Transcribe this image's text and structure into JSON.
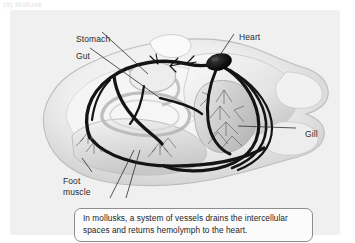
{
  "figure": {
    "header": "(b) Mollusk"
  },
  "panel": {
    "background_color": "#f0f0f0",
    "illustration_name": "mollusk-circulatory-system-illustration"
  },
  "labels": [
    {
      "id": "stomach",
      "text": "Stomach"
    },
    {
      "id": "gut",
      "text": "Gut"
    },
    {
      "id": "heart",
      "text": "Heart"
    },
    {
      "id": "gill",
      "text": "Gill"
    },
    {
      "id": "foot-muscle",
      "text": "Foot\nmuscle"
    }
  ],
  "caption": {
    "text": "In mollusks, a system of vessels drains the intercellular spaces and returns hemolymph to the heart.",
    "border_color": "#8d8d8d",
    "background_color": "#fbfbfb"
  },
  "colors": {
    "vessel": "#141414",
    "leader_line": "#2a2a2a",
    "body_light": "#f7f7f7",
    "body_mid": "#d8d8d8",
    "body_dark": "#a9a9a9",
    "heart": "#0d0d0d"
  }
}
